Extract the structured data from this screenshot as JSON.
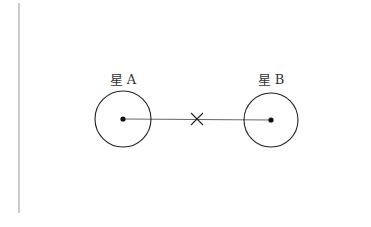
{
  "diagram": {
    "type": "binary-star-system",
    "stars": [
      {
        "label": "星 A",
        "cx": 123,
        "cy": 119,
        "r": 28
      },
      {
        "label": "星 B",
        "cx": 271,
        "cy": 120,
        "r": 27
      }
    ],
    "center_of_mass": {
      "symbol": "×",
      "x": 197,
      "y": 119
    },
    "margin_line": {
      "x": 19,
      "y1": 3,
      "y2": 213,
      "color": "#aaaaaa"
    },
    "colors": {
      "stroke": "#222222",
      "line": "#555555",
      "text": "#333333"
    }
  }
}
